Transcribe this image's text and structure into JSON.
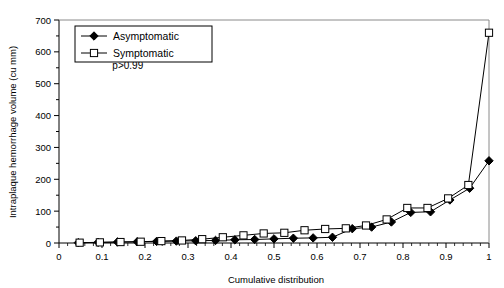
{
  "chart_data": {
    "type": "line",
    "title": "",
    "xlabel": "Cumulative distribution",
    "ylabel": "Intraplaque hemorrhage volume (cu mm)",
    "xlim": [
      0,
      1
    ],
    "ylim": [
      0,
      700
    ],
    "xticks": [
      "0",
      "0.1",
      "0.2",
      "0.3",
      "0.4",
      "0.5",
      "0.6",
      "0.7",
      "0.8",
      "0.9",
      "1"
    ],
    "xtick_values": [
      0,
      0.1,
      0.2,
      0.3,
      0.4,
      0.5,
      0.6,
      0.7,
      0.8,
      0.9,
      1
    ],
    "yticks": [
      "0",
      "100",
      "200",
      "300",
      "400",
      "500",
      "600",
      "700"
    ],
    "ytick_values": [
      0,
      100,
      200,
      300,
      400,
      500,
      600,
      700
    ],
    "minor_ticks": true,
    "grid": false,
    "legend_position": "top-left",
    "annotations": [
      {
        "text": "p>0.99",
        "x": 0.16,
        "y": 545
      }
    ],
    "series": [
      {
        "name": "Asymptomatic",
        "marker": "filled-diamond",
        "color": "#000000",
        "points": [
          {
            "x": 0.045,
            "y": 1
          },
          {
            "x": 0.091,
            "y": 2
          },
          {
            "x": 0.136,
            "y": 3
          },
          {
            "x": 0.182,
            "y": 4
          },
          {
            "x": 0.227,
            "y": 5
          },
          {
            "x": 0.273,
            "y": 6
          },
          {
            "x": 0.318,
            "y": 7
          },
          {
            "x": 0.364,
            "y": 8
          },
          {
            "x": 0.409,
            "y": 10
          },
          {
            "x": 0.455,
            "y": 11
          },
          {
            "x": 0.5,
            "y": 13
          },
          {
            "x": 0.545,
            "y": 15
          },
          {
            "x": 0.591,
            "y": 16
          },
          {
            "x": 0.636,
            "y": 18
          },
          {
            "x": 0.682,
            "y": 45
          },
          {
            "x": 0.727,
            "y": 50
          },
          {
            "x": 0.773,
            "y": 66
          },
          {
            "x": 0.818,
            "y": 96
          },
          {
            "x": 0.864,
            "y": 98
          },
          {
            "x": 0.909,
            "y": 135
          },
          {
            "x": 0.955,
            "y": 172
          },
          {
            "x": 1.0,
            "y": 258
          }
        ]
      },
      {
        "name": "Symptomatic",
        "marker": "open-square",
        "color": "#000000",
        "points": [
          {
            "x": 0.048,
            "y": 1
          },
          {
            "x": 0.095,
            "y": 2
          },
          {
            "x": 0.143,
            "y": 3
          },
          {
            "x": 0.19,
            "y": 4
          },
          {
            "x": 0.238,
            "y": 6
          },
          {
            "x": 0.286,
            "y": 8
          },
          {
            "x": 0.333,
            "y": 12
          },
          {
            "x": 0.381,
            "y": 18
          },
          {
            "x": 0.429,
            "y": 24
          },
          {
            "x": 0.476,
            "y": 30
          },
          {
            "x": 0.524,
            "y": 32
          },
          {
            "x": 0.571,
            "y": 40
          },
          {
            "x": 0.619,
            "y": 44
          },
          {
            "x": 0.667,
            "y": 46
          },
          {
            "x": 0.714,
            "y": 55
          },
          {
            "x": 0.762,
            "y": 74
          },
          {
            "x": 0.81,
            "y": 110
          },
          {
            "x": 0.857,
            "y": 110
          },
          {
            "x": 0.905,
            "y": 140
          },
          {
            "x": 0.952,
            "y": 182
          },
          {
            "x": 1.0,
            "y": 660
          }
        ]
      }
    ]
  },
  "legend": {
    "items": [
      {
        "label": "Asymptomatic",
        "marker": "filled-diamond"
      },
      {
        "label": "Symptomatic",
        "marker": "open-square"
      }
    ]
  },
  "axes": {
    "x_title": "Cumulative distribution",
    "y_title": "Intraplaque hemorrhage volume (cu mm)"
  },
  "colors": {
    "line": "#000000",
    "axis": "#000000",
    "background": "#ffffff"
  }
}
